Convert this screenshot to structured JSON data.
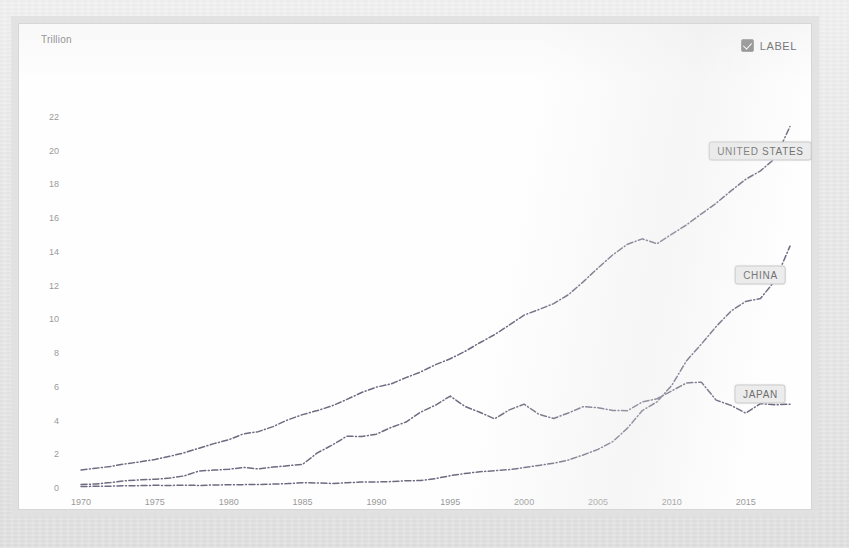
{
  "chart_data": {
    "type": "line",
    "title": "",
    "subtitle": "",
    "ylabel": "Trillion",
    "xlabel": "",
    "ylim": [
      0,
      23
    ],
    "xlim": [
      1970,
      2019
    ],
    "grid": false,
    "legend_position": "inline-callout-right",
    "y_ticks": [
      "22",
      "20",
      "18",
      "16",
      "14",
      "12",
      "10",
      "8",
      "6",
      "4",
      "2",
      "0"
    ],
    "y_tick_values": [
      22,
      20,
      18,
      16,
      14,
      12,
      10,
      8,
      6,
      4,
      2,
      0
    ],
    "x_ticks": [
      "1970",
      "1975",
      "1980",
      "1985",
      "1990",
      "1995",
      "2000",
      "2005",
      "2010",
      "2015"
    ],
    "x_tick_values": [
      1970,
      1975,
      1980,
      1985,
      1990,
      1995,
      2000,
      2005,
      2010,
      2015
    ],
    "x": [
      1970,
      1971,
      1972,
      1973,
      1974,
      1975,
      1976,
      1977,
      1978,
      1979,
      1980,
      1981,
      1982,
      1983,
      1984,
      1985,
      1986,
      1987,
      1988,
      1989,
      1990,
      1991,
      1992,
      1993,
      1994,
      1995,
      1996,
      1997,
      1998,
      1999,
      2000,
      2001,
      2002,
      2003,
      2004,
      2005,
      2006,
      2007,
      2008,
      2009,
      2010,
      2011,
      2012,
      2013,
      2014,
      2015,
      2016,
      2017,
      2018
    ],
    "series": [
      {
        "name": "UNITED STATES",
        "label": "UNITED STATES",
        "color": "#6e6a80",
        "line_style": "dash-dot",
        "values": [
          1.07,
          1.17,
          1.28,
          1.43,
          1.55,
          1.69,
          1.88,
          2.09,
          2.36,
          2.63,
          2.86,
          3.21,
          3.34,
          3.64,
          4.04,
          4.35,
          4.59,
          4.87,
          5.25,
          5.66,
          5.98,
          6.17,
          6.54,
          6.88,
          7.31,
          7.66,
          8.1,
          8.61,
          9.09,
          9.66,
          10.25,
          10.58,
          10.93,
          11.46,
          12.22,
          13.04,
          13.82,
          14.45,
          14.77,
          14.48,
          15.05,
          15.6,
          16.25,
          16.88,
          17.61,
          18.3,
          18.8,
          19.55,
          21.43
        ]
      },
      {
        "name": "CHINA",
        "label": "CHINA",
        "color": "#6e6a80",
        "line_style": "dash-dot",
        "values": [
          0.09,
          0.1,
          0.11,
          0.14,
          0.14,
          0.16,
          0.15,
          0.17,
          0.15,
          0.18,
          0.19,
          0.2,
          0.21,
          0.23,
          0.26,
          0.31,
          0.3,
          0.27,
          0.31,
          0.35,
          0.36,
          0.38,
          0.43,
          0.44,
          0.56,
          0.73,
          0.86,
          0.96,
          1.03,
          1.09,
          1.21,
          1.34,
          1.47,
          1.66,
          1.96,
          2.29,
          2.75,
          3.55,
          4.59,
          5.11,
          6.09,
          7.55,
          8.53,
          9.57,
          10.48,
          11.06,
          11.23,
          12.31,
          14.34
        ]
      },
      {
        "name": "JAPAN",
        "label": "JAPAN",
        "color": "#6e6a80",
        "line_style": "dash-dot",
        "values": [
          0.21,
          0.24,
          0.32,
          0.43,
          0.48,
          0.52,
          0.59,
          0.72,
          1.01,
          1.06,
          1.11,
          1.22,
          1.13,
          1.24,
          1.32,
          1.4,
          2.08,
          2.54,
          3.07,
          3.05,
          3.19,
          3.59,
          3.91,
          4.5,
          4.91,
          5.45,
          4.83,
          4.49,
          4.1,
          4.63,
          4.97,
          4.37,
          4.12,
          4.45,
          4.82,
          4.76,
          4.6,
          4.58,
          5.1,
          5.29,
          5.76,
          6.23,
          6.27,
          5.21,
          4.9,
          4.44,
          5.0,
          4.93,
          4.97
        ]
      }
    ],
    "annotations": [
      {
        "text": "UNITED STATES",
        "series": "UNITED STATES",
        "at_year": 2016,
        "at_value": 20.0
      },
      {
        "text": "CHINA",
        "series": "CHINA",
        "at_year": 2016,
        "at_value": 12.6
      },
      {
        "text": "JAPAN",
        "series": "JAPAN",
        "at_year": 2016,
        "at_value": 5.6
      }
    ]
  },
  "chart": {
    "y_axis_title": "Trillion"
  },
  "controls": {
    "label_toggle": {
      "text": "LABEL",
      "checked": true
    }
  },
  "colors": {
    "line": "#6e6a80",
    "axis_text": "#9a9a9a",
    "panel_background": "#fdfdfd",
    "page_background": "#e9e9e9",
    "callout_background": "#ececec",
    "callout_border": "#c9c9c9"
  }
}
